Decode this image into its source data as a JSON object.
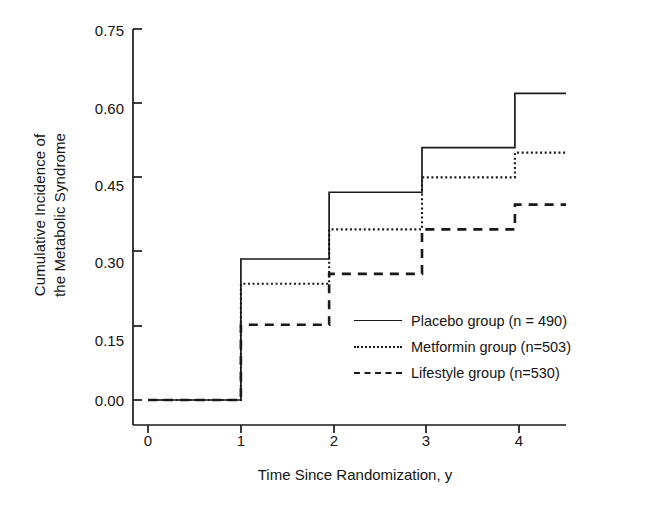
{
  "chart_data": {
    "type": "line",
    "subtype": "step",
    "title": "",
    "xlabel": "Time Since Randomization, y",
    "ylabel": "Cumulative Incidence of the Metabolic Syndrome",
    "ylabel_lines": [
      "Cumulative Incidence of",
      "the Metabolic Syndrome"
    ],
    "xlim": [
      0,
      4.5
    ],
    "ylim": [
      0.0,
      0.75
    ],
    "xticks": [
      0,
      1,
      2,
      3,
      4
    ],
    "xtick_labels": [
      "0",
      "1",
      "2",
      "3",
      "4"
    ],
    "yticks": [
      0.0,
      0.15,
      0.3,
      0.45,
      0.6,
      0.75
    ],
    "ytick_labels": [
      "0.00",
      "0.15",
      "0.30",
      "0.45",
      "0.60",
      "0.75"
    ],
    "grid": false,
    "legend_position": "center-right",
    "series": [
      {
        "name": "Placebo group (n = 490)",
        "style": "solid",
        "color": "#1a1a1a",
        "x": [
          0,
          1,
          1,
          1.95,
          1.95,
          2.95,
          2.95,
          3.95,
          3.95,
          4.5
        ],
        "y": [
          0.0,
          0.0,
          0.285,
          0.285,
          0.42,
          0.42,
          0.51,
          0.51,
          0.62,
          0.62
        ],
        "step_values": [
          0.0,
          0.285,
          0.42,
          0.51,
          0.62
        ]
      },
      {
        "name": "Metformin group (n=503)",
        "style": "dotted",
        "color": "#1a1a1a",
        "x": [
          0,
          1,
          1,
          1.95,
          1.95,
          2.95,
          2.95,
          3.95,
          3.95,
          4.5
        ],
        "y": [
          0.0,
          0.0,
          0.235,
          0.235,
          0.345,
          0.345,
          0.45,
          0.45,
          0.5,
          0.5
        ],
        "step_values": [
          0.0,
          0.235,
          0.345,
          0.45,
          0.5
        ]
      },
      {
        "name": "Lifestyle group (n=530)",
        "style": "dashed",
        "color": "#1a1a1a",
        "x": [
          0,
          1,
          1,
          1.95,
          1.95,
          2.95,
          2.95,
          3.95,
          3.95,
          4.5
        ],
        "y": [
          0.0,
          0.0,
          0.152,
          0.152,
          0.255,
          0.255,
          0.345,
          0.345,
          0.395,
          0.395
        ],
        "step_values": [
          0.0,
          0.152,
          0.255,
          0.345,
          0.395
        ]
      }
    ]
  },
  "legend": {
    "items": [
      {
        "label": "Placebo group (n = 490)",
        "style": "solid"
      },
      {
        "label": "Metformin group (n=503)",
        "style": "dotted"
      },
      {
        "label": "Lifestyle group (n=530)",
        "style": "dashed"
      }
    ]
  },
  "axes": {
    "y_title_line1": "Cumulative Incidence of",
    "y_title_line2": "the Metabolic Syndrome",
    "x_title": "Time Since Randomization, y",
    "ytick_labels": [
      "0.75",
      "0.60",
      "0.45",
      "0.30",
      "0.15",
      "0.00"
    ],
    "xtick_labels": [
      "0",
      "1",
      "2",
      "3",
      "4"
    ]
  },
  "colors": {
    "ink": "#1a1a1a",
    "background": "#ffffff"
  }
}
